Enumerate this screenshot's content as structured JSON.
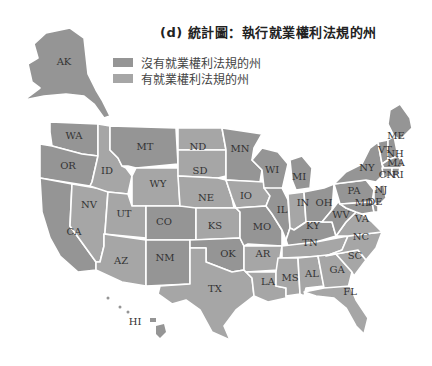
{
  "title": "(d) 統計圖：執行就業權利法規的州",
  "legend": {
    "items": [
      {
        "label": "沒有就業權利法規的州",
        "color": "#959595"
      },
      {
        "label": "有就業權利法規的州",
        "color": "#a6a6a6"
      }
    ]
  },
  "colors": {
    "no_law": "#959595",
    "has_law": "#a6a6a6",
    "border": "#ffffff",
    "label": "#333333"
  },
  "states": {
    "AK": {
      "label": "AK",
      "category": "no_law"
    },
    "HI": {
      "label": "HI",
      "category": "no_law"
    },
    "WA": {
      "label": "WA",
      "category": "no_law"
    },
    "OR": {
      "label": "OR",
      "category": "no_law"
    },
    "CA": {
      "label": "CA",
      "category": "no_law"
    },
    "NV": {
      "label": "NV",
      "category": "has_law"
    },
    "ID": {
      "label": "ID",
      "category": "has_law"
    },
    "MT": {
      "label": "MT",
      "category": "no_law"
    },
    "WY": {
      "label": "WY",
      "category": "has_law"
    },
    "UT": {
      "label": "UT",
      "category": "has_law"
    },
    "AZ": {
      "label": "AZ",
      "category": "has_law"
    },
    "CO": {
      "label": "CO",
      "category": "no_law"
    },
    "NM": {
      "label": "NM",
      "category": "no_law"
    },
    "ND": {
      "label": "ND",
      "category": "has_law"
    },
    "SD": {
      "label": "SD",
      "category": "has_law"
    },
    "NE": {
      "label": "NE",
      "category": "has_law"
    },
    "KS": {
      "label": "KS",
      "category": "has_law"
    },
    "OK": {
      "label": "OK",
      "category": "no_law"
    },
    "TX": {
      "label": "TX",
      "category": "has_law"
    },
    "MN": {
      "label": "MN",
      "category": "no_law"
    },
    "IO": {
      "label": "IO",
      "category": "has_law"
    },
    "MO": {
      "label": "MO",
      "category": "no_law"
    },
    "AR": {
      "label": "AR",
      "category": "has_law"
    },
    "LA": {
      "label": "LA",
      "category": "has_law"
    },
    "WI": {
      "label": "WI",
      "category": "no_law"
    },
    "IL": {
      "label": "IL",
      "category": "no_law"
    },
    "MI": {
      "label": "MI",
      "category": "no_law"
    },
    "IN": {
      "label": "IN",
      "category": "has_law"
    },
    "OH": {
      "label": "OH",
      "category": "no_law"
    },
    "KY": {
      "label": "KY",
      "category": "no_law"
    },
    "TN": {
      "label": "TN",
      "category": "has_law"
    },
    "MS": {
      "label": "MS",
      "category": "has_law"
    },
    "AL": {
      "label": "AL",
      "category": "has_law"
    },
    "GA": {
      "label": "GA",
      "category": "has_law"
    },
    "FL": {
      "label": "FL",
      "category": "has_law"
    },
    "SC": {
      "label": "SC",
      "category": "has_law"
    },
    "NC": {
      "label": "NC",
      "category": "has_law"
    },
    "VA": {
      "label": "VA",
      "category": "has_law"
    },
    "WV": {
      "label": "WV",
      "category": "no_law"
    },
    "PA": {
      "label": "PA",
      "category": "no_law"
    },
    "NY": {
      "label": "NY",
      "category": "no_law"
    },
    "VT": {
      "label": "VT",
      "category": "no_law"
    },
    "NH": {
      "label": "NH",
      "category": "no_law"
    },
    "ME": {
      "label": "ME",
      "category": "no_law"
    },
    "MA": {
      "label": "MA",
      "category": "no_law"
    },
    "CN": {
      "label": "CN",
      "category": "no_law"
    },
    "RI": {
      "label": "RI",
      "category": "no_law"
    },
    "NJ": {
      "label": "NJ",
      "category": "no_law"
    },
    "MD": {
      "label": "MD",
      "category": "no_law"
    },
    "DE": {
      "label": "DE",
      "category": "no_law"
    }
  }
}
